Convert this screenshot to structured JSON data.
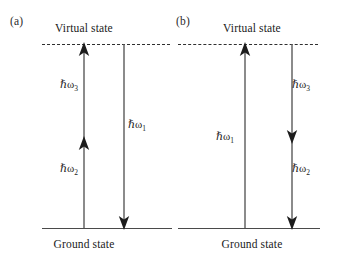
{
  "figure": {
    "type": "energy-level-diagram",
    "panels": [
      {
        "id": "a",
        "label": "(a)",
        "upper_level_label": "Virtual state",
        "lower_level_label": "Ground state",
        "upper_level_style": "dashed",
        "lower_level_style": "solid",
        "transitions": [
          {
            "name": "absorption-omega2",
            "label_hbar": "ℏ",
            "label_omega": "ω",
            "subscript": "2",
            "direction": "up",
            "from": "ground state",
            "to": "intermediate",
            "label_text": "ℏω₂"
          },
          {
            "name": "absorption-omega3",
            "label_hbar": "ℏ",
            "label_omega": "ω",
            "subscript": "3",
            "direction": "up",
            "from": "intermediate",
            "to": "virtual state",
            "label_text": "ℏω₃"
          },
          {
            "name": "emission-omega1",
            "label_hbar": "ℏ",
            "label_omega": "ω",
            "subscript": "1",
            "direction": "down",
            "from": "virtual state",
            "to": "ground state",
            "label_text": "ℏω₁"
          }
        ]
      },
      {
        "id": "b",
        "label": "(b)",
        "upper_level_label": "Virtual state",
        "lower_level_label": "Ground state",
        "upper_level_style": "dashed",
        "lower_level_style": "solid",
        "transitions": [
          {
            "name": "absorption-omega1",
            "label_hbar": "ℏ",
            "label_omega": "ω",
            "subscript": "1",
            "direction": "up",
            "from": "ground state",
            "to": "virtual state",
            "label_text": "ℏω₁"
          },
          {
            "name": "emission-omega3",
            "label_hbar": "ℏ",
            "label_omega": "ω",
            "subscript": "3",
            "direction": "down",
            "from": "virtual state",
            "to": "intermediate",
            "label_text": "ℏω₃"
          },
          {
            "name": "emission-omega2",
            "label_hbar": "ℏ",
            "label_omega": "ω",
            "subscript": "2",
            "direction": "down",
            "from": "intermediate",
            "to": "ground state",
            "label_text": "ℏω₂"
          }
        ]
      }
    ],
    "colors": {
      "background": "#ffffff",
      "line": "#5a5a5a",
      "arrowhead": "#1c1c1c",
      "level": "#4a4a4a",
      "text": "#1a1a1a"
    }
  }
}
